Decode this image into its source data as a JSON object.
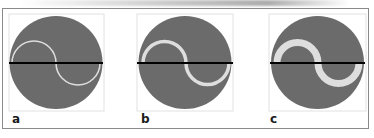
{
  "figure": {
    "panels": [
      {
        "label": "a",
        "stroke_width": 1.5
      },
      {
        "label": "b",
        "stroke_width": 3.5
      },
      {
        "label": "c",
        "stroke_width": 7
      }
    ],
    "colors": {
      "disc_fill": "#6b6b6b",
      "curve_stroke": "#dedede",
      "axis_line": "#000000",
      "panel_box": "#dcdcdc",
      "frame_border": "#8a8a8a"
    }
  }
}
